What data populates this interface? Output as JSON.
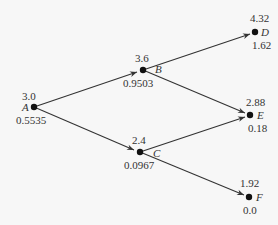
{
  "diagram": {
    "type": "binomial-tree",
    "nodes": [
      {
        "id": "A",
        "name": "A",
        "top": "3.0",
        "bottom": "0.5535"
      },
      {
        "id": "B",
        "name": "B",
        "top": "3.6",
        "bottom": "0.9503"
      },
      {
        "id": "C",
        "name": "C",
        "top": "2.4",
        "bottom": "0.0967"
      },
      {
        "id": "D",
        "name": "D",
        "top": "4.32",
        "bottom": "1.62"
      },
      {
        "id": "E",
        "name": "E",
        "top": "2.88",
        "bottom": "0.18"
      },
      {
        "id": "F",
        "name": "F",
        "top": "1.92",
        "bottom": "0.0"
      }
    ],
    "edges": [
      {
        "from": "A",
        "to": "B"
      },
      {
        "from": "A",
        "to": "C"
      },
      {
        "from": "B",
        "to": "D"
      },
      {
        "from": "B",
        "to": "E"
      },
      {
        "from": "C",
        "to": "E"
      },
      {
        "from": "C",
        "to": "F"
      }
    ]
  }
}
